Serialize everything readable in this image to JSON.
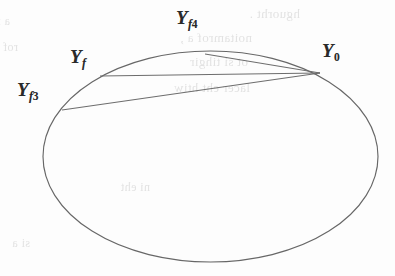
{
  "figure": {
    "kind": "geometry-diagram",
    "background_color": "#fdfdfd",
    "stroke_color": "#676767",
    "label_color": "#2a2a2a",
    "width": 395,
    "height": 276
  },
  "chart_data": {
    "type": "scatter",
    "title": "",
    "xlabel": "",
    "ylabel": "",
    "grid": false,
    "legend": null,
    "xlim": [
      0,
      395
    ],
    "ylim": [
      276,
      0
    ],
    "ellipse": {
      "center_x": 210.5,
      "center_y": 156.5,
      "radius_x": 167.5,
      "radius_y": 105.5,
      "rotation_deg": 0,
      "stroke": "#676767",
      "stroke_width": 1.15,
      "fill": "none"
    },
    "points": [
      {
        "id": "Y0",
        "label": "Y",
        "subscript": "0",
        "x": 320,
        "y": 73
      },
      {
        "id": "Yf4",
        "label": "Y",
        "subscript": "f4",
        "x": 205,
        "y": 54
      },
      {
        "id": "Yf",
        "label": "Y",
        "subscript": "f",
        "x": 100,
        "y": 76
      },
      {
        "id": "Yf3",
        "label": "Y",
        "subscript": "f3",
        "x": 62,
        "y": 110
      }
    ],
    "chords": [
      {
        "id": "chord-y0-yf4",
        "from": "Y0",
        "to": "Yf4",
        "x1": 320,
        "y1": 73,
        "x2": 205,
        "y2": 54
      },
      {
        "id": "chord-y0-yf",
        "from": "Y0",
        "to": "Yf",
        "x1": 320,
        "y1": 73,
        "x2": 100,
        "y2": 76
      },
      {
        "id": "chord-y0-yf3",
        "from": "Y0",
        "to": "Yf3",
        "x1": 320,
        "y1": 73,
        "x2": 62,
        "y2": 110
      }
    ]
  },
  "labels": [
    {
      "id": "label-yf4",
      "base": "Y",
      "sub": "f",
      "sub_digit": "4",
      "left": 176,
      "top": 8
    },
    {
      "id": "label-y0",
      "base": "Y",
      "sub": "",
      "sub_digit": "0",
      "left": 322,
      "top": 41
    },
    {
      "id": "label-yf",
      "base": "Y",
      "sub": "f",
      "sub_digit": "",
      "left": 70,
      "top": 47
    },
    {
      "id": "label-yf3",
      "base": "Y",
      "sub": "f",
      "sub_digit": "3",
      "left": 17,
      "top": 80
    }
  ],
  "ghost_text": [
    {
      "text": "hguorht .",
      "left": 300,
      "top": 6,
      "size": 13
    },
    {
      "text": "noitamrof a ,",
      "left": 252,
      "top": 30,
      "size": 13
    },
    {
      "text": "ot   si  tihgir",
      "left": 248,
      "top": 54,
      "size": 13
    },
    {
      "text": "lacer eht htiw",
      "left": 250,
      "top": 80,
      "size": 13
    },
    {
      "text": "a  ro   si",
      "left": 10,
      "top": 14,
      "size": 12
    },
    {
      "text": "rof  a",
      "left": 18,
      "top": 40,
      "size": 12
    },
    {
      "text": "ni  eht",
      "left": 150,
      "top": 180,
      "size": 12
    },
    {
      "text": "si  a",
      "left": 30,
      "top": 236,
      "size": 12
    }
  ]
}
